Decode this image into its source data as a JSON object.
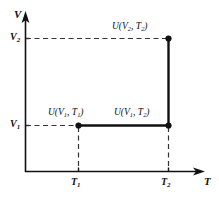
{
  "figure": {
    "type": "thermodynamic-state-diagram",
    "background_color": "#ffffff",
    "line_color": "#111111",
    "width": 219,
    "height": 197
  },
  "axes": {
    "y": {
      "name": "V",
      "arrow": true,
      "ticks": [
        {
          "id": "v1",
          "label_main": "V",
          "label_sub": "1",
          "value": "V1"
        },
        {
          "id": "v2",
          "label_main": "V",
          "label_sub": "2",
          "value": "V2"
        }
      ]
    },
    "x": {
      "name": "T",
      "arrow": true,
      "ticks": [
        {
          "id": "t1",
          "label_main": "T",
          "label_sub": "1",
          "value": "T1"
        },
        {
          "id": "t2",
          "label_main": "T",
          "label_sub": "2",
          "value": "T2"
        }
      ]
    }
  },
  "points": [
    {
      "id": "p-v1t1",
      "label_prefix": "U(",
      "label_var1": "V",
      "label_sub1": "1",
      "label_sep": ", ",
      "label_var2": "T",
      "label_sub2": "1",
      "label_suffix": ")",
      "x_tick": "T1",
      "y_tick": "V1"
    },
    {
      "id": "p-v1t2",
      "label_prefix": "U(",
      "label_var1": "V",
      "label_sub1": "1",
      "label_sep": ", ",
      "label_var2": "T",
      "label_sub2": "2",
      "label_suffix": ")",
      "x_tick": "T2",
      "y_tick": "V1"
    },
    {
      "id": "p-v2t2",
      "label_prefix": "U(",
      "label_var1": "V",
      "label_sub1": "2",
      "label_sep": ", ",
      "label_var2": "T",
      "label_sub2": "2",
      "label_suffix": ")",
      "x_tick": "T2",
      "y_tick": "V2"
    }
  ],
  "paths": [
    {
      "id": "isochore-v1",
      "style": "solid",
      "from": "p-v1t1",
      "to": "p-v1t2"
    },
    {
      "id": "isotherm-t2",
      "style": "solid",
      "from": "p-v1t2",
      "to": "p-v2t2"
    }
  ],
  "guides": [
    {
      "id": "guide-v2-horizontal",
      "style": "dashed"
    },
    {
      "id": "guide-v1-horizontal",
      "style": "dashed"
    },
    {
      "id": "guide-t1-vertical",
      "style": "dashed"
    },
    {
      "id": "guide-t2-vertical",
      "style": "dashed"
    }
  ]
}
